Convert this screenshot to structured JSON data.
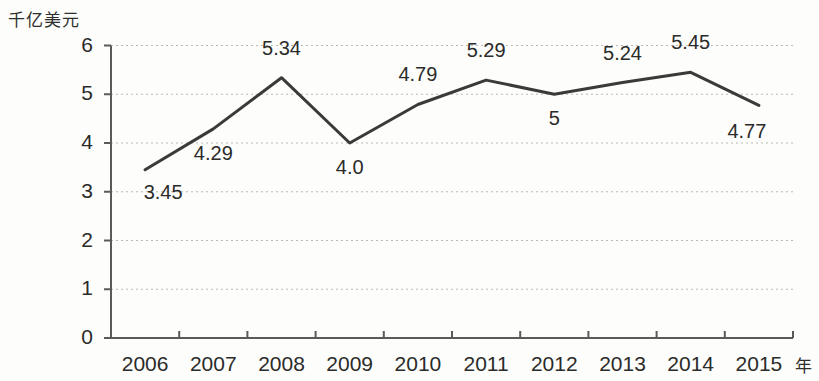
{
  "chart_data": {
    "type": "line",
    "title": "",
    "subtitle": "",
    "ylabel": "千亿美元",
    "xlabel": "年",
    "categories": [
      "2006",
      "2007",
      "2008",
      "2009",
      "2010",
      "2011",
      "2012",
      "2013",
      "2014",
      "2015"
    ],
    "values": [
      3.45,
      4.29,
      5.34,
      4.0,
      4.79,
      5.29,
      5,
      5.24,
      5.45,
      4.77
    ],
    "point_labels": [
      "3.45",
      "4.29",
      "5.34",
      "4.0",
      "4.79",
      "5.29",
      "5",
      "5.24",
      "5.45",
      "4.77"
    ],
    "ylim": [
      0,
      6
    ],
    "yticks": [
      "0",
      "1",
      "2",
      "3",
      "4",
      "5",
      "6"
    ],
    "ytick_values": [
      0,
      1,
      2,
      3,
      4,
      5,
      6
    ],
    "grid": true,
    "grid_style": "dotted-horizontal",
    "legend": null,
    "series": [
      {
        "name": "",
        "values": [
          3.45,
          4.29,
          5.34,
          4.0,
          4.79,
          5.29,
          5,
          5.24,
          5.45,
          4.77
        ]
      }
    ],
    "colors": {
      "line": "#3a3a38",
      "grid": "#b9b9b4",
      "axis": "#5a5a56",
      "text": "#2b2b29",
      "background": "#fdfdfc"
    }
  },
  "label_offsets": [
    {
      "dx": 18,
      "dy": 22
    },
    {
      "dx": 0,
      "dy": 24
    },
    {
      "dx": 0,
      "dy": -30
    },
    {
      "dx": 0,
      "dy": 24
    },
    {
      "dx": 0,
      "dy": -30
    },
    {
      "dx": 0,
      "dy": -30
    },
    {
      "dx": 0,
      "dy": 24
    },
    {
      "dx": 0,
      "dy": -30
    },
    {
      "dx": 0,
      "dy": -30
    },
    {
      "dx": -12,
      "dy": 26
    }
  ]
}
